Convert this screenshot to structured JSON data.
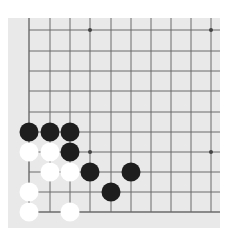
{
  "board": {
    "description": "Go board fragment (bottom-left corner)",
    "background_color": "#e9e9e9",
    "line_color": "#6a6a6a",
    "grid": {
      "columns_x": [
        29,
        50,
        70,
        90,
        111,
        131,
        151,
        171,
        191,
        211
      ],
      "rows_y": [
        30,
        51,
        71,
        91,
        112,
        132,
        152,
        172,
        192,
        212
      ],
      "left_edge_col": 0,
      "bottom_edge_row": 9
    },
    "star_points": [
      {
        "col": 3,
        "row": 0
      },
      {
        "col": 9,
        "row": 0
      },
      {
        "col": 3,
        "row": 6
      },
      {
        "col": 9,
        "row": 6
      }
    ],
    "stones": [
      {
        "color": "black",
        "col": 0,
        "row": 5
      },
      {
        "color": "black",
        "col": 1,
        "row": 5
      },
      {
        "color": "black",
        "col": 2,
        "row": 5
      },
      {
        "color": "white",
        "col": 0,
        "row": 6
      },
      {
        "color": "white",
        "col": 1,
        "row": 6
      },
      {
        "color": "black",
        "col": 2,
        "row": 6
      },
      {
        "color": "white",
        "col": 1,
        "row": 7
      },
      {
        "color": "white",
        "col": 2,
        "row": 7
      },
      {
        "color": "black",
        "col": 3,
        "row": 7
      },
      {
        "color": "black",
        "col": 5,
        "row": 7
      },
      {
        "color": "white",
        "col": 0,
        "row": 8
      },
      {
        "color": "black",
        "col": 4,
        "row": 8
      },
      {
        "color": "white",
        "col": 0,
        "row": 9
      },
      {
        "color": "white",
        "col": 2,
        "row": 9
      }
    ],
    "stone_colors": {
      "black": "#1e1e1e",
      "white": "#ffffff"
    }
  }
}
